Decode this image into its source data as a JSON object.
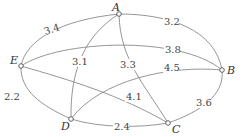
{
  "diagram": {
    "type": "weighted-graph",
    "nodes": [
      {
        "id": "A",
        "label": "A"
      },
      {
        "id": "B",
        "label": "B"
      },
      {
        "id": "C",
        "label": "C"
      },
      {
        "id": "D",
        "label": "D"
      },
      {
        "id": "E",
        "label": "E"
      }
    ],
    "edges": [
      {
        "from": "E",
        "to": "A",
        "weight": "3.4"
      },
      {
        "from": "A",
        "to": "B",
        "weight": "3.2"
      },
      {
        "from": "E",
        "to": "B",
        "weight": "3.8"
      },
      {
        "from": "A",
        "to": "D",
        "weight": "3.1"
      },
      {
        "from": "A",
        "to": "C",
        "weight": "3.3"
      },
      {
        "from": "D",
        "to": "B",
        "weight": "4.5"
      },
      {
        "from": "E",
        "to": "C",
        "weight": "4.1"
      },
      {
        "from": "E",
        "to": "D",
        "weight": "2.2"
      },
      {
        "from": "D",
        "to": "C",
        "weight": "2.4"
      },
      {
        "from": "C",
        "to": "B",
        "weight": "3.6"
      }
    ]
  }
}
